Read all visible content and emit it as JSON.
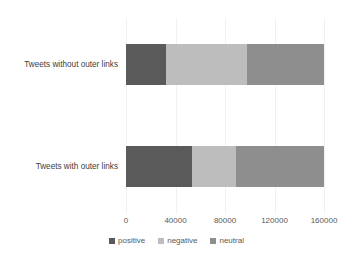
{
  "chart_data": {
    "type": "bar",
    "orientation": "horizontal",
    "stacked": true,
    "title": "",
    "xlabel": "",
    "ylabel": "",
    "xlim": [
      0,
      160000
    ],
    "grid": true,
    "legend_position": "bottom",
    "categories": [
      "Tweets without outer links",
      "Tweets with outer links"
    ],
    "xticks": [
      "0",
      "40000",
      "80000",
      "120000",
      "160000"
    ],
    "xtick_values": [
      0,
      40000,
      80000,
      120000,
      160000
    ],
    "series": [
      {
        "name": "positive",
        "color": "#5a5a5a",
        "values": [
          32000,
          53000
        ]
      },
      {
        "name": "negative",
        "color": "#bdbdbd",
        "values": [
          66000,
          36000
        ]
      },
      {
        "name": "neutral",
        "color": "#8e8e8e",
        "values": [
          62000,
          71000
        ]
      }
    ],
    "totals": [
      160000,
      160000
    ]
  },
  "legend": {
    "items": [
      {
        "label": "positive",
        "color": "#5a5a5a"
      },
      {
        "label": "negative",
        "color": "#bdbdbd"
      },
      {
        "label": "neutral",
        "color": "#8e8e8e"
      }
    ]
  },
  "colors": {
    "positive": "#5a5a5a",
    "negative": "#bdbdbd",
    "neutral": "#8e8e8e",
    "gridline": "#f1f1f1",
    "text": "#595959",
    "background": "#ffffff"
  }
}
